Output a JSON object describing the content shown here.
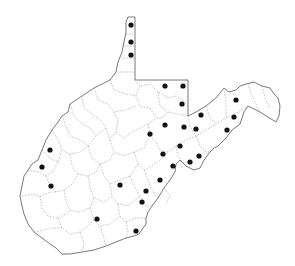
{
  "map": {
    "region": "West Virginia",
    "description": "County outline map with occurrence dots",
    "colors": {
      "background": "#ffffff",
      "outline": "#6a6a6a",
      "county_border": "#9a9a9a",
      "dot": "#111111"
    },
    "dots": [
      {
        "x": 131,
        "y": 25
      },
      {
        "x": 131,
        "y": 42
      },
      {
        "x": 131,
        "y": 55
      },
      {
        "x": 165,
        "y": 86
      },
      {
        "x": 183,
        "y": 86
      },
      {
        "x": 182,
        "y": 104
      },
      {
        "x": 236,
        "y": 100
      },
      {
        "x": 234,
        "y": 117
      },
      {
        "x": 227,
        "y": 130
      },
      {
        "x": 201,
        "y": 115
      },
      {
        "x": 165,
        "y": 125
      },
      {
        "x": 184,
        "y": 127
      },
      {
        "x": 196,
        "y": 129
      },
      {
        "x": 150,
        "y": 134
      },
      {
        "x": 180,
        "y": 146
      },
      {
        "x": 163,
        "y": 154
      },
      {
        "x": 199,
        "y": 156
      },
      {
        "x": 190,
        "y": 162
      },
      {
        "x": 173,
        "y": 166
      },
      {
        "x": 160,
        "y": 180
      },
      {
        "x": 146,
        "y": 191
      },
      {
        "x": 142,
        "y": 202
      },
      {
        "x": 120,
        "y": 185
      },
      {
        "x": 97,
        "y": 219
      },
      {
        "x": 136,
        "y": 231
      },
      {
        "x": 50,
        "y": 150
      },
      {
        "x": 42,
        "y": 167
      },
      {
        "x": 51,
        "y": 186
      }
    ]
  }
}
